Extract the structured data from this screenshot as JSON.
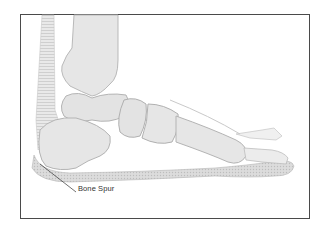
{
  "figure": {
    "annotation_label": "Bone Spur",
    "colors": {
      "frame": "#4a4a4a",
      "bone_fill": "#e6e6e6",
      "bone_outline": "#b9b9b9",
      "tissue": "#cfcfcf",
      "label": "#333333"
    }
  }
}
